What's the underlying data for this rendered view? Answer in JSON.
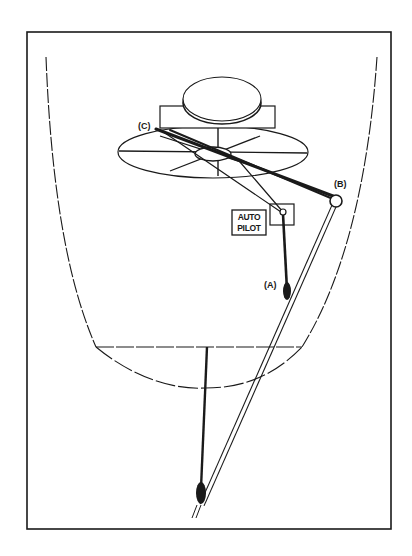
{
  "figure": {
    "width": 412,
    "height": 556,
    "background": "#ffffff",
    "ink_color": "#1a1a1a",
    "frame": {
      "x": 27,
      "y": 32,
      "w": 364,
      "h": 497
    }
  },
  "labels": {
    "c": {
      "text": "(C)",
      "x": 138,
      "y": 129,
      "size": 9
    },
    "b": {
      "text": "(B)",
      "x": 334,
      "y": 187,
      "size": 9
    },
    "a": {
      "text": "(A)",
      "x": 264,
      "y": 288,
      "size": 9
    },
    "autopilot": {
      "line1": "AUTO",
      "line2": "PILOT",
      "box": {
        "x": 232,
        "y": 210,
        "w": 34,
        "h": 25
      }
    }
  },
  "components": {
    "hull": {
      "left_path": "M46,57 C50,160 62,270 96,347",
      "right_path": "M377,57 C370,160 350,270 302,347",
      "waterline": {
        "x1": 96,
        "y1": 347,
        "x2": 302,
        "y2": 347
      },
      "keel_path": "M96,347 C130,375 170,390 205,388 C240,388 272,378 302,347"
    },
    "compass": {
      "top_ellipse": {
        "cx": 222,
        "cy": 99,
        "rx": 39,
        "ry": 22
      },
      "top_ellipse_rim": {
        "cx": 222,
        "cy": 103,
        "rx": 39,
        "ry": 21
      },
      "base_rect": {
        "x": 160,
        "y": 106,
        "w": 115,
        "h": 22
      },
      "mast": {
        "x1": 218,
        "y1": 128,
        "x2": 218,
        "y2": 176
      }
    },
    "wheel_disk": {
      "ellipse": {
        "cx": 213,
        "cy": 152,
        "rx": 95,
        "ry": 26
      },
      "hub": {
        "cx": 213,
        "cy": 154,
        "rx": 18,
        "ry": 7
      },
      "spokes": [
        {
          "x1": 119,
          "y1": 151,
          "x2": 307,
          "y2": 153
        },
        {
          "x1": 160,
          "y1": 136,
          "x2": 266,
          "y2": 170
        },
        {
          "x1": 170,
          "y1": 171,
          "x2": 260,
          "y2": 136
        }
      ]
    },
    "cables": [
      {
        "name": "cable-c-to-b",
        "x1": 156,
        "y1": 129,
        "x2": 333,
        "y2": 196,
        "w": 3
      },
      {
        "name": "cable-c-to-b-inner",
        "x1": 170,
        "y1": 130,
        "x2": 333,
        "y2": 199,
        "w": 2
      },
      {
        "name": "cable-c-to-autopilot",
        "x1": 162,
        "y1": 131,
        "x2": 281,
        "y2": 212,
        "w": 1.2
      },
      {
        "name": "cable-hub-to-autopilot",
        "x1": 240,
        "y1": 162,
        "x2": 283,
        "y2": 212,
        "w": 1.2
      }
    ],
    "pulley_b": {
      "cx": 336,
      "cy": 201,
      "r": 6
    },
    "autopilot_unit": {
      "x": 270,
      "y": 204,
      "w": 24,
      "h": 21,
      "pivot": {
        "cx": 283,
        "cy": 212,
        "r": 3
      }
    },
    "autopilot_rod": {
      "x1": 283,
      "y1": 214,
      "x2": 287,
      "y2": 290,
      "w": 2.6
    },
    "tiller_rod": {
      "x1": 334,
      "y1": 206,
      "x2": 202,
      "y2": 505,
      "gap": 2.2
    },
    "fitting_a": {
      "cx": 287,
      "cy": 291,
      "rx": 4,
      "ry": 9
    },
    "rudder_post": {
      "x1": 207,
      "y1": 347,
      "x2": 201,
      "y2": 488,
      "w": 2.4
    },
    "fitting_bottom": {
      "cx": 201,
      "cy": 493,
      "rx": 5,
      "ry": 11
    },
    "rod_tail": {
      "x1": 199,
      "y1": 505,
      "x2": 194,
      "y2": 518
    }
  }
}
